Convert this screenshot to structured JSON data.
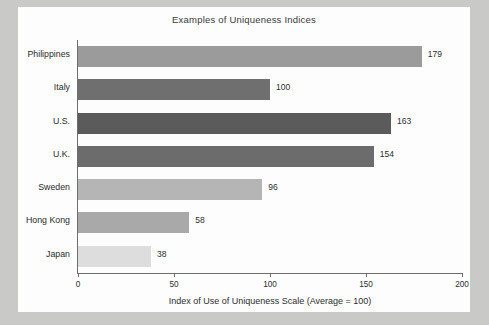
{
  "chart_data": {
    "type": "bar",
    "orientation": "horizontal",
    "title": "Examples of Uniqueness Indices",
    "xlabel": "Index of Use of Uniqueness Scale (Average = 100)",
    "ylabel": "",
    "xlim": [
      0,
      200
    ],
    "xticks": [
      0,
      50,
      100,
      150,
      200
    ],
    "xtick_labels": [
      "0",
      "50",
      "100",
      "150",
      "200"
    ],
    "grid": false,
    "legend": null,
    "categories": [
      "Philippines",
      "Italy",
      "U.S.",
      "U.K.",
      "Sweden",
      "Hong Kong",
      "Japan"
    ],
    "values": [
      179,
      100,
      163,
      154,
      96,
      58,
      38
    ],
    "value_labels": [
      "179",
      "100",
      "163",
      "154",
      "96",
      "58",
      "38"
    ],
    "bar_colors": [
      "#9b9b9b",
      "#6f6f6f",
      "#5b5b5b",
      "#6c6c6c",
      "#b5b5b5",
      "#a9a9a9",
      "#dddddd"
    ]
  },
  "colors": {
    "page_background": "#c9c9c7",
    "card_background": "#fdfdfd",
    "axis": "#6d6d6d",
    "text": "#2e2e2e"
  }
}
